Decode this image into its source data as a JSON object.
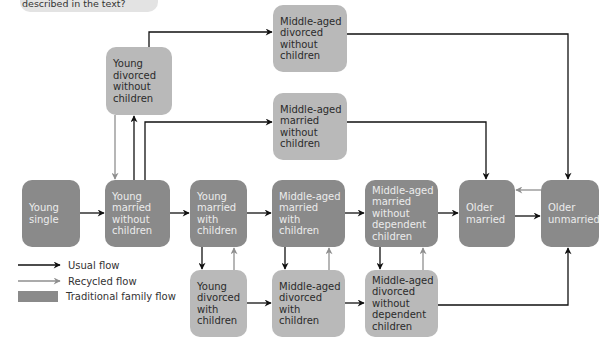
{
  "caption": {
    "text": "described in the text?"
  },
  "colors": {
    "traditional_box": "#8a8a8a",
    "alternative_box": "#b9b9b9",
    "usual_flow": "#111111",
    "recycled_flow": "#8f8f8f"
  },
  "nodes": {
    "young_single": {
      "label": "Young\nsingle",
      "type": "traditional"
    },
    "young_married_no_children": {
      "label": "Young\nmarried\nwithout\nchildren",
      "type": "traditional"
    },
    "young_married_children": {
      "label": "Young\nmarried\nwith\nchildren",
      "type": "traditional"
    },
    "ma_married_children": {
      "label": "Middle-aged\nmarried\nwith\nchildren",
      "type": "traditional"
    },
    "ma_married_no_dependent": {
      "label": "Middle-aged\nmarried\nwithout\ndependent\nchildren",
      "type": "traditional"
    },
    "older_married": {
      "label": "Older\nmarried",
      "type": "traditional"
    },
    "older_unmarried": {
      "label": "Older\nunmarried",
      "type": "traditional"
    },
    "young_divorced_no_children": {
      "label": "Young\ndivorced\nwithout\nchildren",
      "type": "alternative"
    },
    "ma_divorced_no_children": {
      "label": "Middle-aged\ndivorced\nwithout\nchildren",
      "type": "alternative"
    },
    "ma_married_no_children": {
      "label": "Middle-aged\nmarried\nwithout\nchildren",
      "type": "alternative"
    },
    "young_divorced_children": {
      "label": "Young\ndivorced\nwith\nchildren",
      "type": "alternative"
    },
    "ma_divorced_children": {
      "label": "Middle-aged\ndivorced\nwith\nchildren",
      "type": "alternative"
    },
    "ma_divorced_no_dependent": {
      "label": "Middle-aged\ndivorced\nwithout\ndependent\nchildren",
      "type": "alternative"
    }
  },
  "edges": [
    {
      "from": "young_single",
      "to": "young_married_no_children",
      "kind": "usual"
    },
    {
      "from": "young_married_no_children",
      "to": "young_married_children",
      "kind": "usual"
    },
    {
      "from": "young_married_children",
      "to": "ma_married_children",
      "kind": "usual"
    },
    {
      "from": "ma_married_children",
      "to": "ma_married_no_dependent",
      "kind": "usual"
    },
    {
      "from": "ma_married_no_dependent",
      "to": "older_married",
      "kind": "usual"
    },
    {
      "from": "older_married",
      "to": "older_unmarried",
      "kind": "usual"
    },
    {
      "from": "older_unmarried",
      "to": "older_married",
      "kind": "recycled"
    },
    {
      "from": "young_married_no_children",
      "to": "young_divorced_no_children",
      "kind": "usual"
    },
    {
      "from": "young_divorced_no_children",
      "to": "young_married_no_children",
      "kind": "recycled"
    },
    {
      "from": "young_divorced_no_children",
      "to": "ma_divorced_no_children",
      "kind": "usual"
    },
    {
      "from": "young_married_no_children",
      "to": "ma_married_no_children",
      "kind": "usual"
    },
    {
      "from": "ma_divorced_no_children",
      "to": "older_unmarried",
      "kind": "usual"
    },
    {
      "from": "ma_married_no_children",
      "to": "older_married",
      "kind": "usual"
    },
    {
      "from": "young_married_children",
      "to": "young_divorced_children",
      "kind": "usual"
    },
    {
      "from": "young_divorced_children",
      "to": "young_married_children",
      "kind": "recycled"
    },
    {
      "from": "ma_married_children",
      "to": "ma_divorced_children",
      "kind": "usual"
    },
    {
      "from": "ma_divorced_children",
      "to": "ma_married_children",
      "kind": "recycled"
    },
    {
      "from": "ma_married_no_dependent",
      "to": "ma_divorced_no_dependent",
      "kind": "usual"
    },
    {
      "from": "ma_divorced_no_dependent",
      "to": "ma_married_no_dependent",
      "kind": "recycled"
    },
    {
      "from": "young_divorced_children",
      "to": "ma_divorced_children",
      "kind": "usual"
    },
    {
      "from": "ma_divorced_children",
      "to": "ma_divorced_no_dependent",
      "kind": "usual"
    },
    {
      "from": "ma_divorced_no_dependent",
      "to": "older_unmarried",
      "kind": "usual"
    }
  ],
  "legend": {
    "usual": "Usual flow",
    "recycled": "Recycled flow",
    "traditional": "Traditional family flow"
  }
}
